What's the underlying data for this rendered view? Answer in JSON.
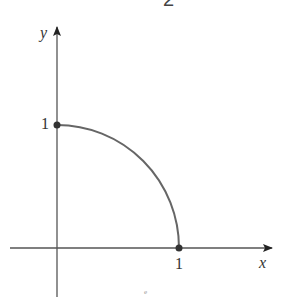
{
  "figure": {
    "top_fragment": "2",
    "axes": {
      "x_label": "x",
      "y_label": "y"
    },
    "tick_labels": {
      "y_one": "1",
      "x_one": "1"
    },
    "curve": {
      "description": "quarter circle arc from (0,1) to (1,0)",
      "start": [
        0,
        1
      ],
      "end": [
        1,
        0
      ],
      "color": "#666666"
    },
    "points": [
      {
        "x": 0,
        "y": 1
      },
      {
        "x": 1,
        "y": 0
      }
    ],
    "stray_mark": "e"
  },
  "colors": {
    "axis": "#555555",
    "curve": "#666666",
    "point": "#333333",
    "text": "#333333"
  }
}
